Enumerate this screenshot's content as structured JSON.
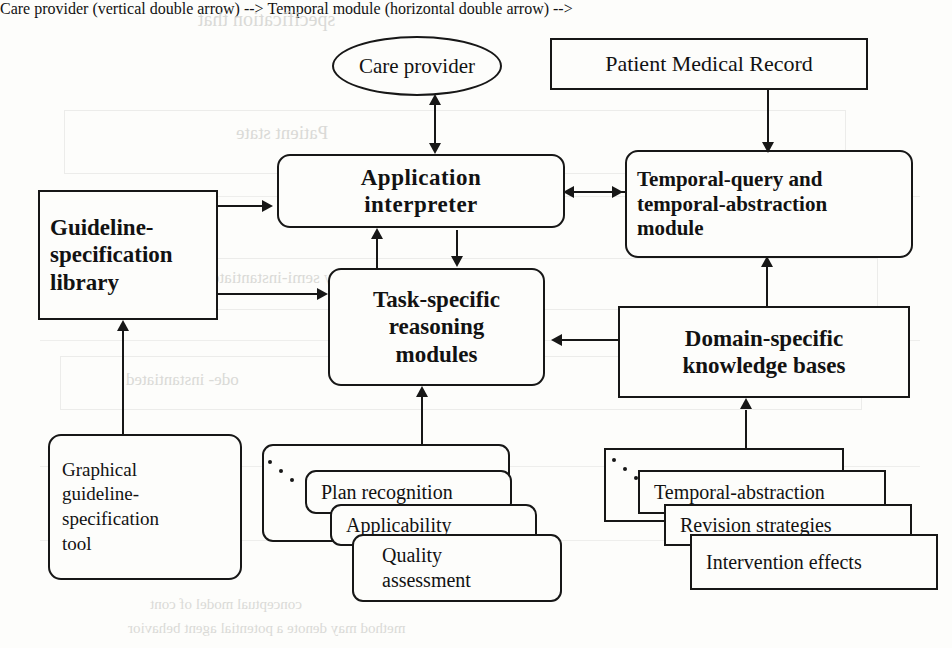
{
  "diagram": {
    "background_color": "#fdfdfb",
    "ink_color": "#171717",
    "nodes": {
      "care_provider": {
        "label": "Care provider",
        "shape": "ellipse"
      },
      "patient_record": {
        "label": "Patient Medical Record",
        "shape": "rectangle"
      },
      "guideline_library": {
        "label": "Guideline-\nspecification\nlibrary",
        "shape": "rectangle"
      },
      "application_interp": {
        "label": "Application\ninterpreter",
        "shape": "rounded-rectangle"
      },
      "temporal_module": {
        "label": "Temporal-query and\ntemporal-abstraction\nmodule",
        "shape": "rounded-rectangle"
      },
      "task_specific": {
        "label": "Task-specific\nreasoning\nmodules",
        "shape": "rounded-rectangle"
      },
      "domain_specific": {
        "label": "Domain-specific\nknowledge bases",
        "shape": "rectangle"
      },
      "graphical_tool": {
        "label": "Graphical\nguideline-\nspecification\ntool",
        "shape": "rounded-rectangle"
      }
    },
    "node_lines": {
      "care_provider": [
        "Care provider"
      ],
      "patient_record": [
        "Patient Medical Record"
      ],
      "guideline_library": [
        "Guideline-",
        "specification",
        "library"
      ],
      "application_interp": [
        "Application",
        "interpreter"
      ],
      "temporal_module": [
        "Temporal-query and",
        "temporal-abstraction",
        "module"
      ],
      "task_specific": [
        "Task-specific",
        "reasoning",
        "modules"
      ],
      "domain_specific": [
        "Domain-specific",
        "knowledge bases"
      ],
      "graphical_tool": [
        "Graphical",
        "guideline-",
        "specification",
        "tool"
      ]
    },
    "task_module_stack": {
      "name": "task-specific reasoning module instances",
      "ellipsis": "...",
      "cards": [
        {
          "label": "Plan  recognition"
        },
        {
          "label": "Applicability"
        },
        {
          "label": "Quality\nassessment"
        }
      ],
      "card_lines": [
        [
          "Plan  recognition"
        ],
        [
          "Applicability"
        ],
        [
          "Quality",
          "assessment"
        ]
      ]
    },
    "knowledge_base_stack": {
      "name": "domain-specific knowledge base instances",
      "ellipsis": "...",
      "cards": [
        {
          "label": "Temporal-abstraction"
        },
        {
          "label": "Revision strategies"
        },
        {
          "label": "Intervention effects"
        }
      ],
      "card_lines": [
        [
          "Temporal-abstraction"
        ],
        [
          "Revision strategies"
        ],
        [
          "Intervention effects"
        ]
      ]
    },
    "connections": [
      {
        "from": "application_interp",
        "to": "care_provider",
        "type": "bidirectional"
      },
      {
        "from": "patient_record",
        "to": "temporal_module",
        "type": "directed"
      },
      {
        "from": "guideline_library",
        "to": "application_interp",
        "type": "directed"
      },
      {
        "from": "guideline_library",
        "to": "task_specific",
        "type": "directed"
      },
      {
        "from": "application_interp",
        "to": "temporal_module",
        "type": "bidirectional"
      },
      {
        "from": "task_specific",
        "to": "application_interp",
        "type": "directed"
      },
      {
        "from": "application_interp",
        "to": "task_specific",
        "type": "directed"
      },
      {
        "from": "domain_specific",
        "to": "task_specific",
        "type": "directed"
      },
      {
        "from": "domain_specific",
        "to": "temporal_module",
        "type": "directed"
      },
      {
        "from": "graphical_tool",
        "to": "guideline_library",
        "type": "directed"
      },
      {
        "from": "task_module_stack",
        "to": "task_specific",
        "type": "directed"
      },
      {
        "from": "knowledge_base_stack",
        "to": "domain_specific",
        "type": "directed"
      }
    ]
  },
  "bleed_through": {
    "note": "faint reverse-page text visible through the scanned paper",
    "fragments": [
      "specification  that",
      "Patient  state",
      "by  semi-instantiate",
      "ode-  instantiated",
      "interventional effects",
      "conceptual model of cont",
      "method  may denote a potential agent behavior"
    ]
  }
}
